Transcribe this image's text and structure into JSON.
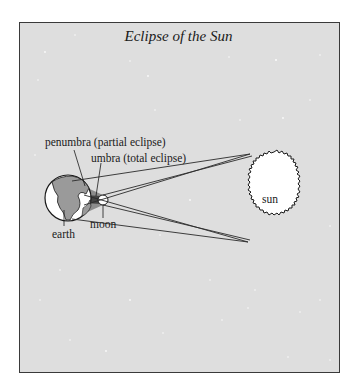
{
  "title": "Eclipse of the Sun",
  "labels": {
    "penumbra": "penumbra (partial eclipse)",
    "umbra": "umbra (total eclipse)",
    "earth": "earth",
    "moon": "moon",
    "sun": "sun"
  },
  "colors": {
    "background": "#dedede",
    "frame": "#3a3a3a",
    "sun_fill": "#ffffff",
    "earth_land": "#9a9a9a",
    "umbra": "#444444",
    "penumbra": "#8c8c8c"
  }
}
